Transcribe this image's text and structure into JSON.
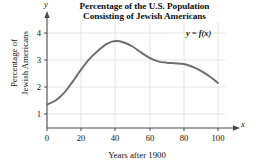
{
  "chart_data": {
    "type": "line",
    "title": "Percentage of the U.S. Population Consisting of Jewish Americans",
    "title_line1": "Percentage of the U.S. Population",
    "title_line2": "Consisting of Jewish Americans",
    "xlabel": "Years after 1900",
    "ylabel": "Percentage of Jewish Americans",
    "ylabel_line1": "Percentage of",
    "ylabel_line2": "Jewish Americans",
    "x_axis_letter": "x",
    "y_axis_letter": "y",
    "annotation": "y = f(x)",
    "xlim": [
      0,
      107
    ],
    "ylim": [
      0,
      4.45
    ],
    "xticks": [
      0,
      20,
      40,
      60,
      80,
      100
    ],
    "yticks": [
      1,
      2,
      3,
      4
    ],
    "grid": true,
    "legend_position": "none",
    "curve_color": "#6e6e6e",
    "grid_color": "#e2e2e2",
    "axis_color": "#4a4a4a",
    "x": [
      0,
      5,
      10,
      15,
      20,
      25,
      30,
      35,
      40,
      45,
      50,
      55,
      60,
      65,
      70,
      75,
      80,
      85,
      90,
      95,
      100
    ],
    "values": [
      1.35,
      1.5,
      1.78,
      2.2,
      2.65,
      3.05,
      3.35,
      3.6,
      3.7,
      3.65,
      3.5,
      3.28,
      3.08,
      2.95,
      2.9,
      2.88,
      2.85,
      2.75,
      2.6,
      2.4,
      2.15
    ],
    "series": [
      {
        "name": "y = f(x)",
        "values": [
          1.35,
          1.5,
          1.78,
          2.2,
          2.65,
          3.05,
          3.35,
          3.6,
          3.7,
          3.65,
          3.5,
          3.28,
          3.08,
          2.95,
          2.9,
          2.88,
          2.85,
          2.75,
          2.6,
          2.4,
          2.15
        ]
      }
    ],
    "peak": {
      "x": 39,
      "y": 3.7
    },
    "start": {
      "x": 0,
      "y": 1.35
    },
    "end": {
      "x": 100,
      "y": 2.15
    }
  }
}
